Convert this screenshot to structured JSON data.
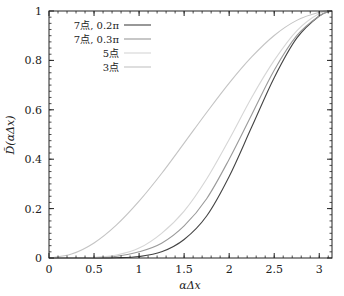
{
  "chart_data": {
    "type": "line",
    "title": "",
    "xlabel": "αΔx",
    "ylabel": "D̃(αΔx)",
    "xlim": [
      0,
      3.1416
    ],
    "ylim": [
      0,
      1
    ],
    "grid": false,
    "legend_position": "upper-left-inside",
    "x_ticks": [
      "0",
      "0.5",
      "1",
      "1.5",
      "2",
      "2.5",
      "3"
    ],
    "y_ticks": [
      "0",
      "0.2",
      "0.4",
      "0.6",
      "0.8",
      "1"
    ],
    "x": [
      0,
      0.25,
      0.5,
      0.75,
      1.0,
      1.25,
      1.5,
      1.75,
      2.0,
      2.25,
      2.5,
      2.75,
      3.0,
      3.1416
    ],
    "series": [
      {
        "name": "7点, 0.2π",
        "color": "#444444",
        "values": [
          0,
          0,
          0,
          0.001,
          0.006,
          0.025,
          0.075,
          0.17,
          0.33,
          0.53,
          0.73,
          0.89,
          0.98,
          1
        ]
      },
      {
        "name": "7点, 0.3π",
        "color": "#9a9a9a",
        "values": [
          0,
          0,
          0.001,
          0.007,
          0.025,
          0.06,
          0.13,
          0.24,
          0.4,
          0.58,
          0.76,
          0.9,
          0.98,
          1
        ]
      },
      {
        "name": "5点",
        "color": "#d6d6d6",
        "values": [
          0,
          0,
          0.002,
          0.012,
          0.04,
          0.1,
          0.19,
          0.32,
          0.48,
          0.65,
          0.8,
          0.92,
          0.99,
          1
        ]
      },
      {
        "name": "3点",
        "color": "#c4c4c4",
        "values": [
          0,
          0.016,
          0.061,
          0.134,
          0.23,
          0.342,
          0.465,
          0.589,
          0.708,
          0.814,
          0.901,
          0.962,
          0.995,
          1
        ]
      }
    ]
  }
}
